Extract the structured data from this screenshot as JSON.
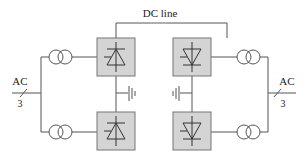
{
  "diagram": {
    "dc_line_label": "DC line",
    "left_ac": {
      "label": "AC",
      "phases": "3"
    },
    "right_ac": {
      "label": "AC",
      "phases": "3"
    },
    "converters": [
      {
        "id": "rectifier-top",
        "type": "rectifier"
      },
      {
        "id": "rectifier-bottom",
        "type": "rectifier"
      },
      {
        "id": "inverter-top",
        "type": "inverter"
      },
      {
        "id": "inverter-bottom",
        "type": "inverter"
      }
    ],
    "colors": {
      "line": "#555555",
      "box_fill": "#d4d4d4",
      "box_stroke": "#777777"
    }
  }
}
